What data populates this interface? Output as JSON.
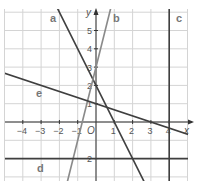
{
  "chart_data": {
    "type": "line",
    "title": "",
    "xlabel": "x",
    "ylabel": "y",
    "origin_label": "O",
    "xlim": [
      -5,
      5
    ],
    "ylim": [
      -3.2,
      6.2
    ],
    "grid": true,
    "x_ticks": [
      -4,
      -3,
      -2,
      -1,
      1,
      2,
      3,
      4
    ],
    "x_tick_labels": [
      "−4",
      "−3",
      "−2",
      "−1",
      "1",
      "2",
      "3",
      "4"
    ],
    "y_ticks": [
      5,
      4,
      3,
      2,
      1,
      -2
    ],
    "y_tick_labels": [
      "5",
      "4",
      "3",
      "2",
      "1",
      "2"
    ],
    "series": [
      {
        "name": "a",
        "kind": "line",
        "equation": "y = -2x + 2",
        "slope": -2,
        "intercept": 2,
        "color": "#3f3f3f"
      },
      {
        "name": "b",
        "kind": "line",
        "equation": "y = 4x + 3",
        "slope": 4,
        "intercept": 3,
        "color": "#8a8a8a"
      },
      {
        "name": "c",
        "kind": "vertical",
        "equation": "x = 4",
        "x": 4,
        "color": "#3f3f3f"
      },
      {
        "name": "d",
        "kind": "horizontal",
        "equation": "y = -2",
        "y": -2,
        "color": "#3f3f3f"
      },
      {
        "name": "e",
        "kind": "line",
        "equation": "y = -x/3 + 1",
        "slope": -0.3333,
        "intercept": 1,
        "color": "#3f3f3f"
      }
    ],
    "legend": "inline labels (a, b, c, d, e)"
  },
  "labels": {
    "a": "a",
    "b": "b",
    "c": "c",
    "d": "d",
    "e": "e",
    "x_axis": "x",
    "y_axis": "y",
    "origin": "O"
  }
}
